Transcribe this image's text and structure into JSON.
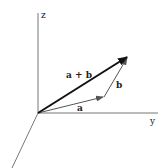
{
  "diagram": {
    "type": "vector-addition-3d",
    "axes": {
      "z": {
        "label": "z"
      },
      "y": {
        "label": "y"
      },
      "x": {
        "label": ""
      }
    },
    "vectors": [
      {
        "id": "a",
        "label": "a"
      },
      {
        "id": "b",
        "label": "b"
      },
      {
        "id": "sum",
        "label": "a + b"
      }
    ],
    "colors": {
      "axis": "#777777",
      "vector": "#555555",
      "sum": "#111111",
      "text": "#222222"
    }
  }
}
